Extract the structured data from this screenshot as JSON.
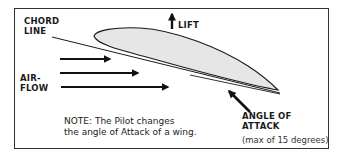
{
  "diagram": {
    "title": "Angle of Attack",
    "labels": {
      "chord_line": [
        "CHORD",
        "LINE"
      ],
      "airflow": [
        "AIR-",
        "FLOW"
      ],
      "lift": "LIFT",
      "angle_of_attack": [
        "ANGLE OF",
        "ATTACK"
      ],
      "angle_limit": "(max of 15 degrees)"
    },
    "note": [
      "NOTE: The Pilot changes",
      "the angle of Attack of a wing."
    ],
    "elements": {
      "airfoil": "airfoil-shape",
      "chord_line": "chord-line",
      "airflow_arrows": 3,
      "lift_arrow": "up-arrow",
      "angle_arrow": "diagonal-arrow"
    },
    "colors": {
      "airfoil_fill": "#e6e6e6",
      "stroke": "#1a1a1a",
      "border": "#333333",
      "background": "#ffffff"
    }
  }
}
